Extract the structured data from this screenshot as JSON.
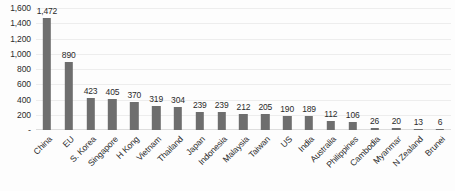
{
  "chart_data": {
    "type": "bar",
    "title": "",
    "subtitle": "",
    "xlabel": "",
    "ylabel": "",
    "ylim": [
      0,
      1600
    ],
    "grid": true,
    "legend": false,
    "legend_position": "none",
    "bar_color": "#6e6e6e",
    "background_color": "#ffffff",
    "gridline_color": "#ededed",
    "axis_color": "#dddddd",
    "label_rotation": -45,
    "y_ticks": [
      "-",
      "200",
      "400",
      "600",
      "800",
      "1,000",
      "1,200",
      "1,400",
      "1,600"
    ],
    "y_tick_values": [
      0,
      200,
      400,
      600,
      800,
      1000,
      1200,
      1400,
      1600
    ],
    "categories": [
      "China",
      "EU",
      "S. Korea",
      "Singapore",
      "H Kong",
      "Vietnam",
      "Thailand",
      "Japan",
      "Indonesia",
      "Malaysia",
      "Taiwan",
      "US",
      "India",
      "Australia",
      "Philippines",
      "Cambodia",
      "Myanmar",
      "N Zealand",
      "Brunei"
    ],
    "values": [
      1472,
      890,
      423,
      405,
      370,
      319,
      304,
      239,
      239,
      212,
      205,
      190,
      189,
      112,
      106,
      26,
      20,
      13,
      6
    ],
    "value_labels": [
      "1,472",
      "890",
      "423",
      "405",
      "370",
      "319",
      "304",
      "239",
      "239",
      "212",
      "205",
      "190",
      "189",
      "112",
      "106",
      "26",
      "20",
      "13",
      "6"
    ]
  }
}
